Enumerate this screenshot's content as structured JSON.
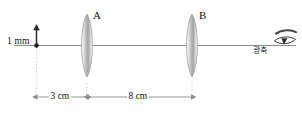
{
  "figure": {
    "type": "optics-ray-diagram"
  },
  "object": {
    "height_label": "1 mm",
    "marker": "upward-arrow"
  },
  "lenses": [
    {
      "id": "A",
      "label": "A",
      "kind": "biconvex-converging"
    },
    {
      "id": "B",
      "label": "B",
      "kind": "biconvex-converging"
    }
  ],
  "axis": {
    "label": "광축",
    "label_meaning": "optical axis"
  },
  "observer": {
    "icon": "eye-icon"
  },
  "dimensions": [
    {
      "id": "object-to-A",
      "label": "3 cm"
    },
    {
      "id": "A-to-B",
      "label": "8 cm"
    }
  ],
  "colors": {
    "axis_line": "#8d8d8d",
    "lens_fill_light": "#f4f4f4",
    "lens_fill_dark": "#9d9d9d",
    "lens_outline": "#9a9a9a",
    "dimension_line": "#8a8a8a",
    "guide_line": "#c9c9c9",
    "text": "#111111",
    "object_marker": "#2b2b2b"
  }
}
